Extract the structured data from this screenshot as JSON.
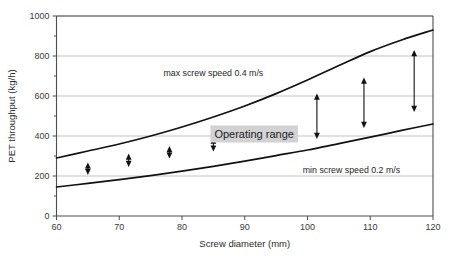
{
  "chart_data": {
    "type": "line",
    "title": "",
    "xlabel": "Screw diameter (mm)",
    "ylabel": "PET throughput (kg/h)",
    "xlim": [
      60,
      120
    ],
    "ylim": [
      0,
      1000
    ],
    "xticks": [
      60,
      70,
      80,
      90,
      100,
      110,
      120
    ],
    "yticks": [
      0,
      200,
      400,
      600,
      800,
      1000
    ],
    "xtick_labels": [
      "60",
      "70",
      "80",
      "90",
      "100",
      "110",
      "120"
    ],
    "ytick_labels": [
      "0",
      "200",
      "400",
      "600",
      "800",
      "1000"
    ],
    "grid": "horizontal",
    "legend": "none",
    "series": [
      {
        "name": "max screw speed 0.4 m/s",
        "x": [
          60,
          65,
          70,
          75,
          80,
          85,
          90,
          95,
          100,
          105,
          110,
          115,
          120
        ],
        "values": [
          290,
          325,
          360,
          400,
          445,
          495,
          550,
          612,
          680,
          752,
          822,
          880,
          930
        ]
      },
      {
        "name": "min screw speed 0.2 m/s",
        "x": [
          60,
          65,
          70,
          75,
          80,
          85,
          90,
          95,
          100,
          105,
          110,
          115,
          120
        ],
        "values": [
          145,
          163,
          182,
          202,
          224,
          248,
          274,
          302,
          330,
          362,
          394,
          428,
          460
        ]
      }
    ],
    "annotations": [
      {
        "text": "max screw speed 0.4 m/s",
        "x": 85,
        "y": 700
      },
      {
        "text": "min screw speed 0.2 m/s",
        "x": 107,
        "y": 215
      },
      {
        "text": "Operating range",
        "x": 91.5,
        "y": 410,
        "highlight": true
      }
    ],
    "range_markers": [
      {
        "x": 65,
        "low": 205,
        "high": 268
      },
      {
        "x": 71.5,
        "low": 245,
        "high": 312
      },
      {
        "x": 78,
        "low": 287,
        "high": 350
      },
      {
        "x": 85,
        "low": 322,
        "high": 392
      },
      {
        "x": 101.5,
        "low": 385,
        "high": 612
      },
      {
        "x": 109,
        "low": 440,
        "high": 692
      },
      {
        "x": 117,
        "low": 520,
        "high": 830
      }
    ]
  },
  "colors": {
    "curve": "#111111",
    "grid": "#b4b4b4",
    "axis": "#4d4d4d",
    "highlight_bg": "#d2d2d2",
    "text": "#262626",
    "background": "#ffffff"
  },
  "labels": {
    "xlabel": "Screw diameter (mm)",
    "ylabel": "PET throughput (kg/h)",
    "max_speed": "max screw speed 0.4 m/s",
    "min_speed": "min screw speed 0.2 m/s",
    "operating_range": "Operating range"
  }
}
